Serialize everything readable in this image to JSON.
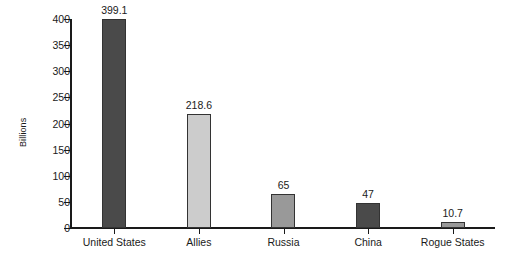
{
  "chart_data": {
    "type": "bar",
    "title": "",
    "subtitle": "",
    "xlabel": "",
    "ylabel": "Billions",
    "categories": [
      "United States",
      "Allies",
      "Russia",
      "China",
      "Rogue States"
    ],
    "values": [
      399.1,
      218.6,
      65,
      47,
      10.7
    ],
    "value_labels": [
      "399.1",
      "218.6",
      "65",
      "47",
      "10.7"
    ],
    "bar_colors": [
      "#4a4a4a",
      "#cccccc",
      "#999999",
      "#4a4a4a",
      "#999999"
    ],
    "bar_border_color": "#333333",
    "ylim": [
      0,
      400
    ],
    "ytick_values": [
      0,
      50,
      100,
      150,
      200,
      250,
      300,
      350,
      400
    ],
    "ytick_labels": [
      "0",
      "50",
      "100",
      "150",
      "200",
      "250",
      "300",
      "350",
      "400"
    ],
    "grid": false,
    "legend": null,
    "axis_color": "#1a1a1a",
    "background_color": "#ffffff"
  }
}
